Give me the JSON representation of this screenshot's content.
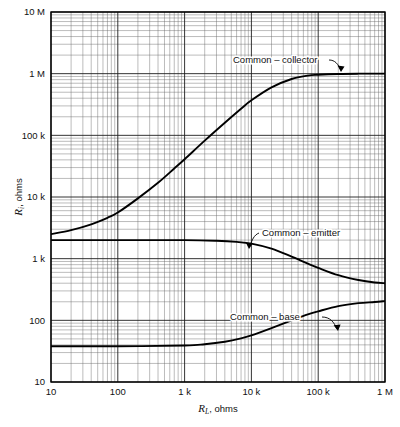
{
  "chart_data": {
    "type": "line",
    "title": "",
    "subtitle": "",
    "xlabel": "R_L, ohms",
    "xlabel_symbol": "R",
    "xlabel_subscript": "L",
    "xlabel_unit": ", ohms",
    "ylabel": "R_i, ohms",
    "ylabel_symbol": "R",
    "ylabel_subscript": "i",
    "ylabel_unit": ", ohms",
    "xscale": "log",
    "yscale": "log",
    "xlim": [
      10,
      1000000
    ],
    "ylim": [
      10,
      10000000
    ],
    "grid": true,
    "grid_minor": true,
    "legend_position": "inline-annotations",
    "xticks": [
      10,
      100,
      1000,
      10000,
      100000,
      1000000
    ],
    "xtick_labels": [
      "10",
      "100",
      "1 k",
      "10 k",
      "100 k",
      "1 M"
    ],
    "yticks": [
      10,
      100,
      1000,
      10000,
      100000,
      1000000,
      10000000
    ],
    "ytick_labels": [
      "10",
      "100",
      "1 k",
      "10 k",
      "100 k",
      "1 M",
      "10 M"
    ],
    "series": [
      {
        "name": "Common – collector",
        "label": "Common – collector",
        "color": "#000000",
        "x": [
          10,
          20,
          40,
          70,
          100,
          200,
          400,
          700,
          1000,
          2000,
          4000,
          7000,
          10000,
          20000,
          40000,
          70000,
          100000,
          200000,
          400000,
          700000,
          1000000
        ],
        "y": [
          2500,
          2900,
          3600,
          4600,
          5600,
          9500,
          17000,
          29000,
          41000,
          82000,
          160000,
          270000,
          370000,
          600000,
          820000,
          930000,
          960000,
          990000,
          1000000,
          1000000,
          1000000
        ]
      },
      {
        "name": "Common – emitter",
        "label": "Common – emitter",
        "color": "#000000",
        "x": [
          10,
          100,
          1000,
          3000,
          6000,
          10000,
          20000,
          40000,
          70000,
          100000,
          200000,
          400000,
          700000,
          1000000
        ],
        "y": [
          2000,
          2000,
          2000,
          1950,
          1870,
          1750,
          1450,
          1080,
          830,
          710,
          540,
          450,
          410,
          400
        ]
      },
      {
        "name": "Common – base",
        "label": "Common – base",
        "color": "#000000",
        "x": [
          10,
          100,
          1000,
          2000,
          4000,
          7000,
          10000,
          20000,
          40000,
          70000,
          100000,
          200000,
          400000,
          700000,
          1000000
        ],
        "y": [
          38,
          38,
          39,
          41,
          45,
          51,
          57,
          75,
          100,
          125,
          140,
          170,
          190,
          198,
          205
        ]
      }
    ],
    "annotations": [
      {
        "text": "Common – collector",
        "series": "Common – collector",
        "anchor": "end-left",
        "leader": "arrow-down-right"
      },
      {
        "text": "Common – emitter",
        "series": "Common – emitter",
        "anchor": "start-right",
        "leader": "arrow-down-left"
      },
      {
        "text": "Common – base",
        "series": "Common – base",
        "anchor": "end-left",
        "leader": "arrow-down-right"
      }
    ]
  }
}
